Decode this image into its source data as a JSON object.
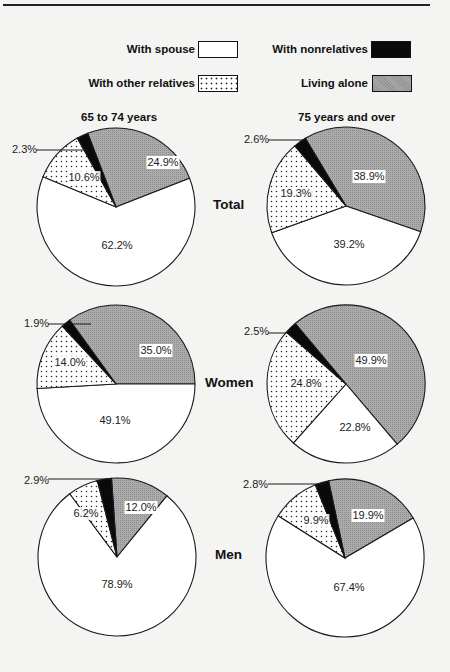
{
  "legend": {
    "items": [
      {
        "key": "spouse",
        "label": "With spouse",
        "fill": "white"
      },
      {
        "key": "other",
        "label": "With other relatives",
        "fill": "dots"
      },
      {
        "key": "nonrel",
        "label": "With nonrelatives",
        "fill": "black"
      },
      {
        "key": "alone",
        "label": "Living alone",
        "fill": "gray-hatch"
      }
    ]
  },
  "columns": [
    "65 to 74 years",
    "75 years and over"
  ],
  "rows": [
    "Total",
    "Women",
    "Men"
  ],
  "colors": {
    "spouse": "#ffffff",
    "other": "#ffffff",
    "nonrel": "#0a0a0a",
    "alone": "#a9a9a9",
    "line": "#1a1a1a"
  },
  "chart_data": {
    "type": "pie",
    "title": "",
    "categories": [
      "Living alone",
      "With spouse",
      "With other relatives",
      "With nonrelatives"
    ],
    "charts": [
      {
        "row": "Total",
        "column": "65 to 74 years",
        "values": [
          24.9,
          62.2,
          10.6,
          2.3
        ],
        "labels": [
          "24.9%",
          "62.2%",
          "10.6%",
          "2.3%"
        ]
      },
      {
        "row": "Total",
        "column": "75 years and over",
        "values": [
          38.9,
          39.2,
          19.3,
          2.6
        ],
        "labels": [
          "38.9%",
          "39.2%",
          "19.3%",
          "2.6%"
        ]
      },
      {
        "row": "Women",
        "column": "65 to 74 years",
        "values": [
          35.0,
          49.1,
          14.0,
          1.9
        ],
        "labels": [
          "35.0%",
          "49.1%",
          "14.0%",
          "1.9%"
        ]
      },
      {
        "row": "Women",
        "column": "75 years and over",
        "values": [
          49.9,
          22.8,
          24.8,
          2.5
        ],
        "labels": [
          "49.9%",
          "22.8%",
          "24.8%",
          "2.5%"
        ]
      },
      {
        "row": "Men",
        "column": "65 to 74 years",
        "values": [
          12.0,
          78.9,
          6.2,
          2.9
        ],
        "labels": [
          "12.0%",
          "78.9%",
          "6.2%",
          "2.9%"
        ]
      },
      {
        "row": "Men",
        "column": "75 years and over",
        "values": [
          19.9,
          67.4,
          9.9,
          2.8
        ],
        "labels": [
          "19.9%",
          "67.4%",
          "9.9%",
          "2.8%"
        ]
      }
    ]
  }
}
